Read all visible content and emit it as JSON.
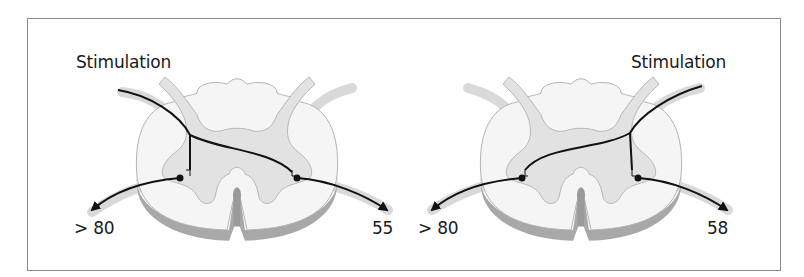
{
  "figure": {
    "panels": [
      {
        "id": "left",
        "stimulation_label": "Stimulation",
        "stimulation_side": "left",
        "ipsilateral_value": "> 80",
        "contralateral_value": "55"
      },
      {
        "id": "right",
        "stimulation_label": "Stimulation",
        "stimulation_side": "right",
        "ipsilateral_value": "58",
        "contralateral_value": "> 80"
      }
    ],
    "colors": {
      "border": "#8a8a8a",
      "white_matter": "#f4f4f4",
      "gray_matter": "#e2e2e2",
      "cord_shadow": "#a8a8a8",
      "nerve_root": "#d9d9d9",
      "pathway": "#111111"
    }
  }
}
